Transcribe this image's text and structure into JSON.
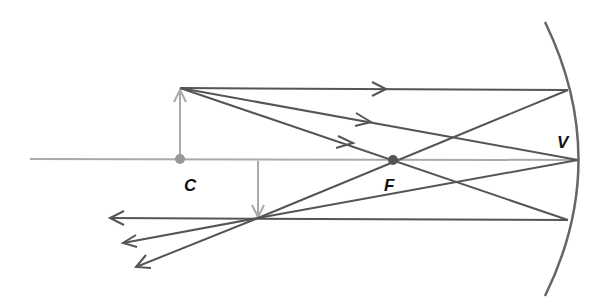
{
  "diagram": {
    "labels": {
      "center_of_curvature": "C",
      "focal_point": "F",
      "vertex": "V"
    },
    "colors": {
      "ray": "#555555",
      "axis": "#aaaaaa",
      "object": "#aaaaaa",
      "point": "#999999",
      "focal_point": "#555555",
      "mirror": "#666666"
    },
    "points": {
      "C": [
        180,
        159
      ],
      "F": [
        393,
        160
      ],
      "V": [
        578,
        160
      ],
      "object_tip": [
        180,
        88
      ],
      "image_tip": [
        258,
        218
      ]
    }
  }
}
